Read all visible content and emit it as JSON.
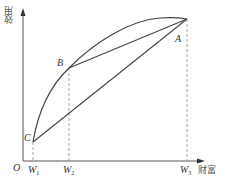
{
  "diagram": {
    "type": "utility-of-wealth",
    "axes": {
      "y_label": "效用",
      "x_label": "财富",
      "origin_label": "O"
    },
    "x_ticks": [
      {
        "main": "W",
        "sub": "1"
      },
      {
        "main": "W",
        "sub": "2"
      },
      {
        "main": "W",
        "sub": "3"
      }
    ],
    "points": {
      "A": "A",
      "B": "B",
      "C": "C"
    },
    "elements": [
      "concave utility curve from C through B to A",
      "chord B–A",
      "chord C–A",
      "dashed vertical line at W1 from C",
      "dashed vertical line at W2 from B",
      "dashed vertical line at W3 from A"
    ],
    "colors": {
      "line": "#444444",
      "dashed": "#999999",
      "axis": "#555555",
      "text": "#333333"
    }
  }
}
